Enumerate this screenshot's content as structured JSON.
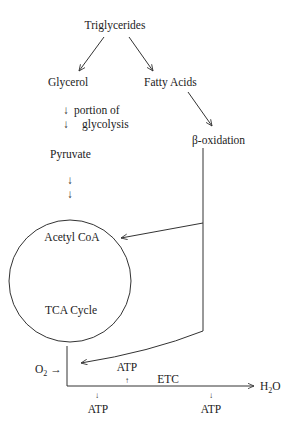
{
  "diagram": {
    "nodes": {
      "triglycerides": "Triglycerides",
      "glycerol": "Glycerol",
      "fatty_acids": "Fatty Acids",
      "glycolysis_line1": "portion of",
      "glycolysis_line2": "glycolysis",
      "beta_oxidation": "β-oxidation",
      "pyruvate": "Pyruvate",
      "acetyl_coa": "Acetyl CoA",
      "tca_cycle": "TCA Cycle",
      "o2": "O",
      "o2_sub": "2",
      "o2_arrow": "→",
      "etc": "ETC",
      "h2o_h": "H",
      "h2o_sub": "2",
      "h2o_o": "O",
      "atp_up": "ATP",
      "atp_down_left": "ATP",
      "atp_down_right": "ATP",
      "down_arrow": "↓",
      "up_arrow": "↑"
    },
    "colors": {
      "ink": "#222222",
      "background": "#ffffff"
    }
  }
}
